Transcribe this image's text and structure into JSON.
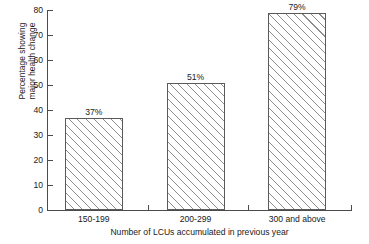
{
  "chart_data": {
    "type": "bar",
    "title": "",
    "subtitle": "",
    "categories": [
      "150-199",
      "200-299",
      "300 and above"
    ],
    "values": [
      37,
      51,
      79
    ],
    "data_labels": [
      "37%",
      "51%",
      "79%"
    ],
    "xlabel": "Number of LCUs accumulated in previous year",
    "ylabel_line1": "Percentage showing",
    "ylabel_line2": "major health change",
    "ylim": [
      0,
      80
    ],
    "ytick_labels": [
      "0",
      "10",
      "20",
      "30",
      "40",
      "50",
      "60",
      "70",
      "80"
    ],
    "ytick_values": [
      0,
      10,
      20,
      30,
      40,
      50,
      60,
      70,
      80
    ],
    "ytick_step": 10,
    "grid": false,
    "legend": false,
    "legend_position": "none",
    "bar_fill": "hatch-diagonal",
    "bar_edge_color": "#5a5a5a",
    "hatch_color": "#8d8d8d",
    "axis_color": "#4c4c4c",
    "background_color": "#ffffff",
    "x_tick_positions": [
      0,
      101,
      201,
      304
    ]
  }
}
